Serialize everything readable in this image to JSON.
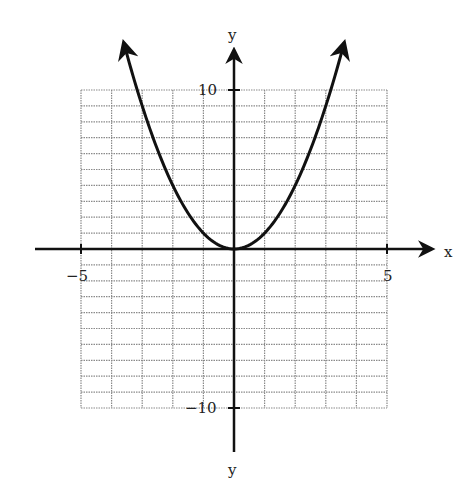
{
  "chart_data": {
    "type": "line",
    "title": "",
    "equation": "y = x^2",
    "xlabel": "x",
    "ylabel": "y",
    "ylabel_bottom": "y",
    "xlim": [
      -5,
      5
    ],
    "ylim": [
      -10,
      10
    ],
    "grid": true,
    "grid_x_step": 1,
    "grid_y_step": 1,
    "tick_labels": {
      "x_left": "−5",
      "x_right": "5",
      "y_top": "10",
      "y_bottom": "−10"
    },
    "series": [
      {
        "name": "parabola",
        "x": [
          -3.6,
          -3,
          -2,
          -1,
          0,
          1,
          2,
          3,
          3.6
        ],
        "values": [
          12.96,
          9,
          4,
          1,
          0,
          1,
          4,
          9,
          12.96
        ],
        "arrows_at_ends": true
      }
    ],
    "colors": {
      "curve": "#111111",
      "axis": "#111111",
      "grid": "#8a8a8a"
    }
  }
}
